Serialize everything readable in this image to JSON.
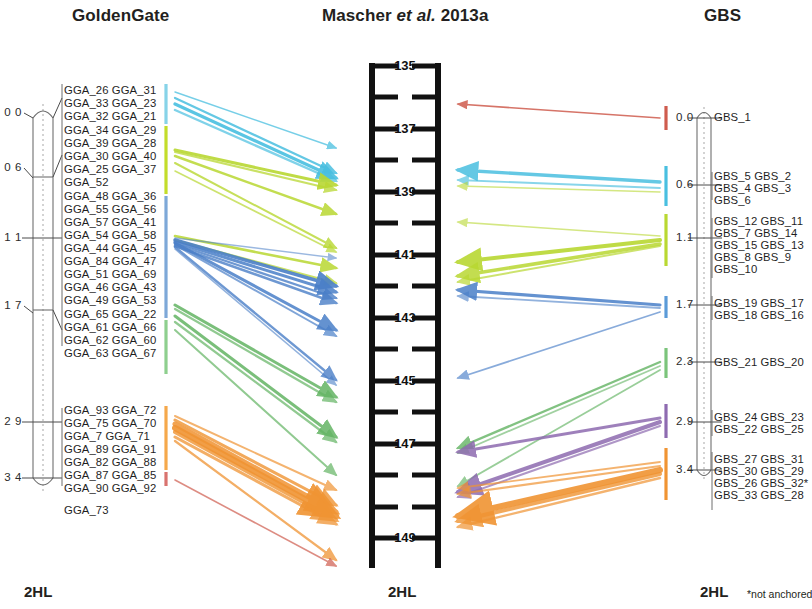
{
  "columns": {
    "goldengate": {
      "title": "GoldenGate",
      "footer": "2HL",
      "positions": [
        "0 0",
        "0 6",
        "1 1",
        "1 7",
        "2 9",
        "3 4"
      ],
      "marker_groups": [
        {
          "color": "#86d3e8",
          "lines": [
            "GGA_26 GGA_31",
            "GGA_33 GGA_23",
            "GGA_32 GGA_21"
          ]
        },
        {
          "color": "#c3dd2a",
          "lines": [
            "GGA_34 GGA_29",
            "GGA_39 GGA_28",
            "GGA_30 GGA_40",
            "GGA_25 GGA_37",
            "GGA_52"
          ]
        },
        {
          "color": "#7ea8d8",
          "lines": [
            "GGA_48 GGA_36",
            "GGA_55 GGA_56",
            "GGA_57 GGA_41",
            "GGA_54 GGA_58",
            "GGA_44 GGA_45",
            "GGA_84 GGA_47",
            "GGA_51 GGA_69",
            "GGA_46 GGA_43",
            "GGA_49 GGA_53"
          ]
        },
        {
          "color": "#8ecf8e",
          "lines": [
            "GGA_65 GGA_22",
            "GGA_61 GGA_66",
            "GGA_62 GGA_60",
            "GGA_63 GGA_67"
          ]
        },
        {
          "color": "#f5a84b",
          "lines": [
            "GGA_93 GGA_72",
            "GGA_75 GGA_70",
            "GGA_7 GGA_71",
            "GGA_89 GGA_91",
            "GGA_82 GGA_88",
            "GGA_87 GGA_85",
            "GGA_90 GGA_92"
          ]
        },
        {
          "color": "#d9736f",
          "lines": [
            "GGA_73"
          ]
        }
      ]
    },
    "mascher": {
      "title_main": "Mascher",
      "title_italic": "et al.",
      "title_year": "2013a",
      "footer": "2HL",
      "axis_labels": [
        "135",
        "137",
        "139",
        "141",
        "143",
        "145",
        "147",
        "149"
      ],
      "axis_unlabeled_tick_count": 7
    },
    "gbs": {
      "title": "GBS",
      "footer": "2HL",
      "note": "*not anchored",
      "positions": [
        "0.0",
        "0.6",
        "1.1",
        "1.7",
        "2.3",
        "2.9",
        "3.4"
      ],
      "marker_groups": [
        {
          "color": "#cf5c4e",
          "lines": [
            "GBS_1"
          ]
        },
        {
          "color": "#49bfe0",
          "lines": [
            "GBS_5 GBS_2",
            "GBS_4 GBS_3",
            "GBS_6"
          ]
        },
        {
          "color": "#b9d832",
          "lines": [
            "GBS_12 GBS_11",
            "GBS_7 GBS_14",
            "GBS_15 GBS_13",
            "GBS_8 GBS_9",
            "GBS_10"
          ]
        },
        {
          "color": "#5b9bd8",
          "lines": [
            "GBS_19 GBS_17",
            "GBS_18 GBS_16"
          ]
        },
        {
          "color": "#7bc47b",
          "lines": [
            "GBS_21 GBS_20"
          ]
        },
        {
          "color": "#8e6bb0",
          "lines": [
            "GBS_24 GBS_23",
            "GBS_22 GBS_25"
          ]
        },
        {
          "color": "#f09433",
          "lines": [
            "GBS_27 GBS_31",
            "GBS_30 GBS_29",
            "GBS_26 GBS_32*",
            "GBS_33 GBS_28"
          ]
        }
      ]
    }
  },
  "palette": {
    "cyan": "#49bfe0",
    "yellow_green": "#b9d832",
    "blue": "#4a7fc8",
    "green": "#63b463",
    "orange": "#f09433",
    "red": "#cf5c4e",
    "purple": "#8e6bb0",
    "chromosome_stroke": "#6f6f6f",
    "ladder": "#111111"
  }
}
